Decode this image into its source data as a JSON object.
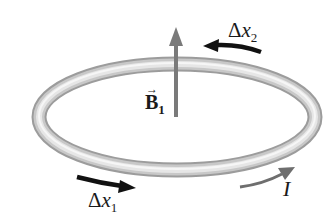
{
  "diagram": {
    "labels": {
      "field": "B",
      "field_subscript": "1",
      "field_vector_mark": "→",
      "dx2_delta": "Δ",
      "dx2_var": "x",
      "dx2_subscript": "2",
      "dx1_delta": "Δ",
      "dx1_var": "x",
      "dx1_subscript": "1",
      "current": "I"
    },
    "colors": {
      "ring_light": "#f2f2f2",
      "ring_mid": "#c4c4c4",
      "ring_dark": "#9a9a9a",
      "field_arrow": "#7a7a7a",
      "dx_arrow": "#111111",
      "current_arrow": "#6e6e6e"
    }
  }
}
